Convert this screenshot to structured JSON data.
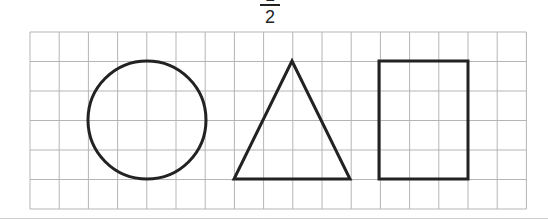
{
  "header": {
    "fraction": {
      "numerator": "1",
      "denominator": "2"
    }
  },
  "grid": {
    "left": 30,
    "top": 32,
    "cols": 17,
    "rows": 6,
    "cell_w": 29.2,
    "cell_h": 29.5,
    "line_color": "#b5b5b5"
  },
  "shapes": [
    {
      "type": "circle",
      "name": "circle",
      "cx": 147,
      "cy": 120,
      "r": 59
    },
    {
      "type": "triangle",
      "name": "triangle",
      "points": [
        [
          292,
          61
        ],
        [
          234,
          179
        ],
        [
          350,
          179
        ]
      ]
    },
    {
      "type": "square",
      "name": "square",
      "x": 379,
      "y": 61,
      "w": 89,
      "h": 118
    }
  ],
  "stroke_color": "#222222"
}
